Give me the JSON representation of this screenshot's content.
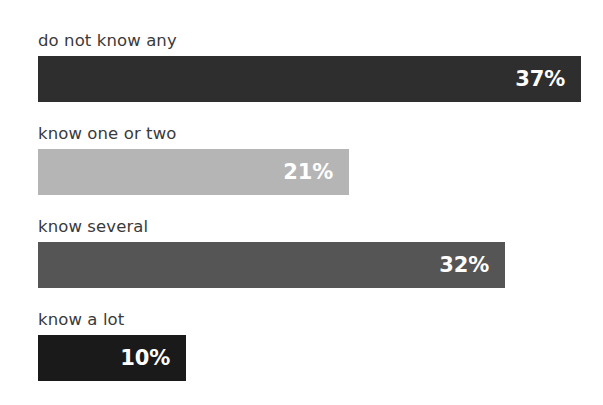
{
  "chart_data": {
    "type": "bar",
    "orientation": "horizontal",
    "title": "",
    "subtitle": "",
    "xlabel": "",
    "ylabel": "",
    "grid": false,
    "legend": null,
    "value_suffix": "%",
    "categories": [
      "do not know any",
      "know one or two",
      "know several",
      "know a lot"
    ],
    "values": [
      37,
      32,
      21,
      10
    ],
    "bars": [
      {
        "label": "do not know any",
        "value": 37,
        "value_text": "37%",
        "color": "#2e2e2e",
        "bar_width_px": 543,
        "label_color": "#3a3a3a",
        "value_color": "#ffffff"
      },
      {
        "label": "know one or two",
        "value": 21,
        "value_text": "21%",
        "color": "#b5b5b5",
        "bar_width_px": 311,
        "label_color": "#3a3a3a",
        "value_color": "#ffffff"
      },
      {
        "label": "know several",
        "value": 32,
        "value_text": "32%",
        "color": "#555555",
        "bar_width_px": 467,
        "label_color": "#3a3a3a",
        "value_color": "#ffffff"
      },
      {
        "label": "know a lot",
        "value": 10,
        "value_text": "10%",
        "color": "#1a1a1a",
        "bar_width_px": 148,
        "label_color": "#3a3a3a",
        "value_color": "#ffffff"
      }
    ],
    "background_color": "#ffffff"
  }
}
